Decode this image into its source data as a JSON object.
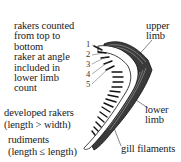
{
  "figure": {
    "annotations": {
      "counting_note": [
        "rakers counted",
        "from top to",
        "bottom",
        "raker at angle",
        "included in",
        "lower limb",
        "count"
      ],
      "developed_rakers": [
        "developed rakers",
        "(length > width)"
      ],
      "rudiments": [
        "rudiments",
        "(length ≤ length)"
      ],
      "upper_limb": [
        "upper",
        "limb"
      ],
      "lower_limb": [
        "lower",
        "limb"
      ],
      "gill_filaments": "gill filaments"
    },
    "raker_numbers": [
      "1",
      "2",
      "3",
      "4",
      "5"
    ],
    "colors": {
      "ink": "#1a1a1a",
      "background": "#ffffff"
    }
  }
}
